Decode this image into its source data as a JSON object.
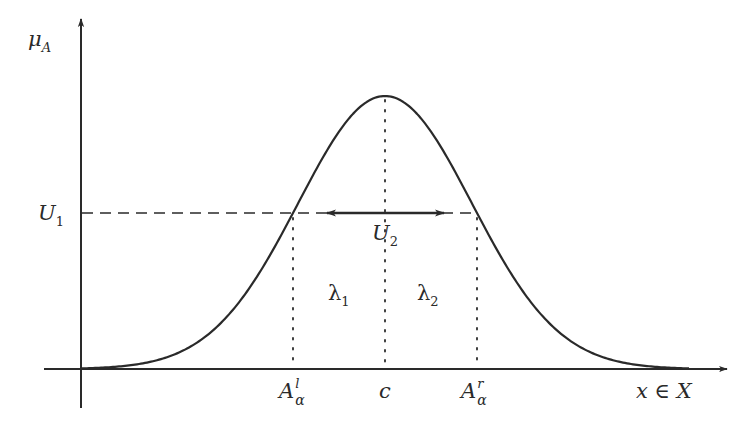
{
  "diagram": {
    "type": "fuzzy-membership-function",
    "colors": {
      "background": "#ffffff",
      "stroke": "#2a2a2a",
      "text": "#2a2a2a"
    },
    "axes": {
      "y_label": {
        "main": "μ",
        "sub": "A"
      },
      "x_label": {
        "main": "x ∈ X"
      }
    },
    "levels": {
      "alpha_level": {
        "main": "U",
        "sub": "1"
      }
    },
    "annotations": {
      "width_arrow": {
        "main": "U",
        "sub": "2"
      },
      "left_region": {
        "main": "λ",
        "sub": "1"
      },
      "right_region": {
        "main": "λ",
        "sub": "2"
      }
    },
    "x_ticks": [
      {
        "id": "left-alpha-cut",
        "main": "A",
        "sup": "l",
        "sub": "α"
      },
      {
        "id": "center",
        "main": "c"
      },
      {
        "id": "right-alpha-cut",
        "main": "A",
        "sup": "r",
        "sub": "α"
      }
    ],
    "geometry": {
      "origin": [
        81,
        369
      ],
      "y_axis_top": 18,
      "x_axis_right": 727,
      "peak": [
        385,
        96
      ],
      "alpha_line_y": 213,
      "left_cut_x": 293,
      "right_cut_x": 477,
      "arrow_from_x": 326,
      "arrow_to_x": 445
    }
  }
}
